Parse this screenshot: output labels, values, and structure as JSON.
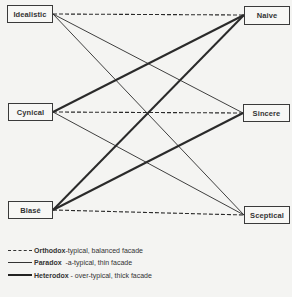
{
  "nodes": {
    "left": [
      {
        "id": "idealistic",
        "label": "Idealistic",
        "x": 7,
        "y": 5,
        "w": 46,
        "h": 18,
        "anchor": [
          53,
          14
        ]
      },
      {
        "id": "cynical",
        "label": "Cynical",
        "x": 8,
        "y": 103,
        "w": 45,
        "h": 18,
        "anchor": [
          53,
          112
        ]
      },
      {
        "id": "blase",
        "label": "Blasé",
        "x": 8,
        "y": 201,
        "w": 45,
        "h": 18,
        "anchor": [
          53,
          210
        ]
      }
    ],
    "right": [
      {
        "id": "naive",
        "label": "Naive",
        "x": 244,
        "y": 6,
        "w": 46,
        "h": 19,
        "anchor": [
          244,
          15
        ]
      },
      {
        "id": "sincere",
        "label": "Sincere",
        "x": 243,
        "y": 104,
        "w": 47,
        "h": 18,
        "anchor": [
          243,
          113
        ]
      },
      {
        "id": "sceptical",
        "label": "Sceptical",
        "x": 244,
        "y": 206,
        "w": 46,
        "h": 18,
        "anchor": [
          244,
          215
        ]
      }
    ]
  },
  "edges": [
    {
      "from": "idealistic",
      "to": "naive",
      "type": "orthodox"
    },
    {
      "from": "idealistic",
      "to": "sincere",
      "type": "paradox"
    },
    {
      "from": "idealistic",
      "to": "sceptical",
      "type": "paradox"
    },
    {
      "from": "cynical",
      "to": "naive",
      "type": "heterodox"
    },
    {
      "from": "cynical",
      "to": "sincere",
      "type": "orthodox"
    },
    {
      "from": "cynical",
      "to": "sceptical",
      "type": "paradox"
    },
    {
      "from": "blase",
      "to": "naive",
      "type": "heterodox"
    },
    {
      "from": "blase",
      "to": "sincere",
      "type": "heterodox"
    },
    {
      "from": "blase",
      "to": "sceptical",
      "type": "orthodox"
    }
  ],
  "legend": [
    {
      "type": "orthodox",
      "term": "Orthodox",
      "separator": "-",
      "description": "typical, balanced facade"
    },
    {
      "type": "paradox",
      "term": "Paradox",
      "separator": "  -",
      "description": "a-typical, thin facade"
    },
    {
      "type": "heterodox",
      "term": "Heterodox",
      "separator": " - ",
      "description": "over-typical, thick facade"
    }
  ],
  "styles": {
    "line_color": "#2a2a2a",
    "background": "#f4f4f2"
  }
}
